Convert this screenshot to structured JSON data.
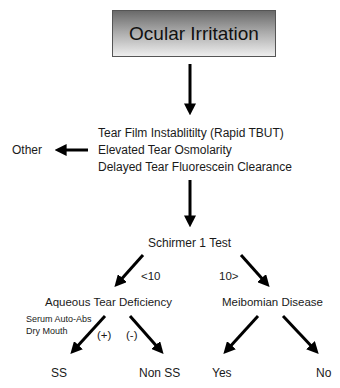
{
  "diagram": {
    "type": "flowchart",
    "root": {
      "label": "Ocular Irritation"
    },
    "criteria": {
      "lines": [
        "Tear Film Instablitilty (Rapid TBUT)",
        "Elevated Tear Osmolarity",
        "Delayed Tear Fluorescein Clearance"
      ]
    },
    "side_branch": {
      "label": "Other"
    },
    "test": {
      "label": "Schirmer 1 Test"
    },
    "thresholds": {
      "left": "<10",
      "right": "10>"
    },
    "left_branch": {
      "label": "Aqueous Tear Deficiency",
      "notes": [
        "Serum Auto-Abs",
        "Dry Mouth"
      ],
      "signs": {
        "positive": "(+)",
        "negative": "(-)"
      },
      "outcomes": {
        "positive": "SS",
        "negative": "Non SS"
      }
    },
    "right_branch": {
      "label": "Meibomian Disease",
      "outcomes": {
        "yes": "Yes",
        "no": "No"
      }
    }
  }
}
